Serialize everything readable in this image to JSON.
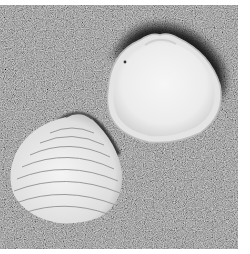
{
  "image": {
    "subject": "two clam shells on sand",
    "style": "grayscale photograph",
    "objects": [
      {
        "name": "open-shell-interior",
        "position": "top-right"
      },
      {
        "name": "closed-shell-exterior",
        "position": "bottom-left"
      }
    ],
    "colors": {
      "sand": "#6e6e6e",
      "shell_light": "#f2f2f2",
      "shadow": "#1a1a1a",
      "border": "#ffffff"
    }
  }
}
